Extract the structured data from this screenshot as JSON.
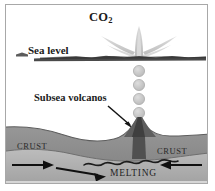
{
  "figure": {
    "labels": {
      "co2_main": "CO",
      "co2_sub": "2",
      "sea_level": "Sea level",
      "subsea_volcanos": "Subsea volcanos",
      "crust_left": "CRUST",
      "crust_right": "CRUST",
      "melting": "MELTING"
    },
    "colors": {
      "background": "#ffffff",
      "frame_border": "#a8a8a8",
      "sea_surface_line": "#4a4a4a",
      "crust_fill": "#8c8c8c",
      "crust_dark": "#6d6d6d",
      "mantle_fill": "#b0b0b0",
      "volcano_fill": "#5e5e5e",
      "conduit_fill": "#3f3f3f",
      "bubble_fill": "#c2c2c2",
      "bubble_stroke": "#9a9a9a",
      "plume_fill": "#c9c9c9",
      "arrow_stroke": "#141414",
      "text": "#1b1b1b"
    },
    "elements": {
      "bubble_count": 5,
      "bubble_x": 133,
      "bubble_radius": 5.6,
      "bubble_ys": [
        66,
        80,
        94,
        108,
        121
      ],
      "plume_apex_y": 22,
      "sea_level_y": 52,
      "seafloor_left_y": 127,
      "seafloor_right_y": 131,
      "melting_wave_y": 155,
      "flow_arrows_left": 2,
      "flow_arrows_right": 1
    }
  }
}
